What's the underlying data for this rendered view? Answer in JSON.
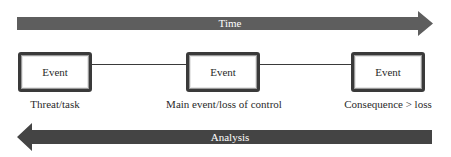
{
  "time_arrow": {
    "label": "Time",
    "direction": "right",
    "color": "#5e5e5e"
  },
  "events": [
    {
      "box_label": "Event",
      "caption": "Threat/task"
    },
    {
      "box_label": "Event",
      "caption": "Main event/loss of control"
    },
    {
      "box_label": "Event",
      "caption": "Consequence > loss"
    }
  ],
  "analysis_arrow": {
    "label": "Analysis",
    "direction": "left",
    "color": "#444444"
  }
}
